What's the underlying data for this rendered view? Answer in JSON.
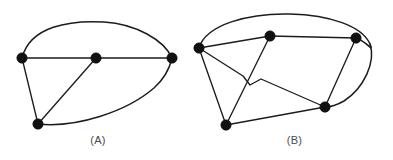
{
  "figure": {
    "width": 393,
    "height": 160,
    "background_color": "#ffffff",
    "ink_color": "#1c1c1c",
    "vertex_color": "#111111",
    "caption_color": "#4a4a4a"
  },
  "panels": [
    {
      "id": "panel-a",
      "caption": "(A)",
      "kind": "graph-diagram",
      "vertex_count": 4,
      "edge_count": 6,
      "vertices": [
        {
          "name": "vertex-a-left",
          "label": "left",
          "x": 22,
          "y": 58,
          "r": 5.2,
          "degree": 4
        },
        {
          "name": "vertex-a-center",
          "label": "center",
          "x": 96,
          "y": 58,
          "r": 5.2,
          "degree": 3
        },
        {
          "name": "vertex-a-right",
          "label": "right",
          "x": 172,
          "y": 58,
          "r": 5.2,
          "degree": 4
        },
        {
          "name": "vertex-a-bottom",
          "label": "bottom",
          "x": 38,
          "y": 124,
          "r": 5.2,
          "degree": 3
        }
      ],
      "edges": [
        {
          "name": "edge-a-left-center",
          "from": "left",
          "to": "center",
          "shape": "straight",
          "path": "M 22 58 L 96 58"
        },
        {
          "name": "edge-a-center-right",
          "from": "center",
          "to": "right",
          "shape": "straight",
          "path": "M 96 58 L 172 58"
        },
        {
          "name": "edge-a-left-bottom",
          "from": "left",
          "to": "bottom",
          "shape": "straight",
          "path": "M 22 58 L 38 124"
        },
        {
          "name": "edge-a-center-bottom",
          "from": "center",
          "to": "bottom",
          "shape": "straight",
          "path": "M 96 58 L 38 124"
        },
        {
          "name": "edge-a-left-right-top",
          "from": "left",
          "to": "right",
          "shape": "arc-top",
          "path": "M 22 58 C 30 26 70 20 104 22 C 136 24 164 40 172 58"
        },
        {
          "name": "edge-a-bottom-right-arc",
          "from": "bottom",
          "to": "right",
          "shape": "arc-bottom",
          "path": "M 38 124 C 76 128 126 112 154 88 C 165 78 170 67 172 58"
        }
      ]
    },
    {
      "id": "panel-b",
      "caption": "(B)",
      "kind": "graph-diagram",
      "vertex_count": 5,
      "edge_count": 8,
      "vertices": [
        {
          "name": "vertex-b-left",
          "label": "left",
          "x": 199,
          "y": 48,
          "r": 5.2,
          "degree": 5
        },
        {
          "name": "vertex-b-top",
          "label": "top",
          "x": 270,
          "y": 36,
          "r": 5.2,
          "degree": 3
        },
        {
          "name": "vertex-b-top-right",
          "label": "top-right",
          "x": 356,
          "y": 38,
          "r": 5.2,
          "degree": 3
        },
        {
          "name": "vertex-b-bottom-right",
          "label": "bottom-right",
          "x": 325,
          "y": 107,
          "r": 5.2,
          "degree": 4
        },
        {
          "name": "vertex-b-bottom-left",
          "label": "bottom-left",
          "x": 226,
          "y": 125,
          "r": 5.2,
          "degree": 3
        }
      ],
      "edges": [
        {
          "name": "edge-b-left-top",
          "from": "left",
          "to": "top",
          "shape": "straight",
          "path": "M 199 48 L 270 36"
        },
        {
          "name": "edge-b-top-topright",
          "from": "top",
          "to": "top-right",
          "shape": "straight",
          "path": "M 270 36 L 356 38"
        },
        {
          "name": "edge-b-topright-bottomright",
          "from": "top-right",
          "to": "bottom-right",
          "shape": "straight",
          "path": "M 356 38 L 325 107"
        },
        {
          "name": "edge-b-left-bottomleft",
          "from": "left",
          "to": "bottom-left",
          "shape": "straight",
          "path": "M 199 48 L 226 125"
        },
        {
          "name": "edge-b-top-bottomleft",
          "from": "top",
          "to": "bottom-left",
          "shape": "straight",
          "path": "M 270 36 L 226 125"
        },
        {
          "name": "edge-b-bottomleft-bottomright",
          "from": "bottom-left",
          "to": "bottom-right",
          "shape": "straight",
          "path": "M 226 125 L 325 107"
        },
        {
          "name": "edge-b-left-bottomright-kink",
          "from": "left",
          "to": "bottom-right",
          "shape": "polyline-kinked",
          "path": "M 199 48 L 243 76 L 250 85 L 261 79 L 325 107"
        },
        {
          "name": "edge-b-left-topright-outer",
          "from": "left",
          "to": "top-right",
          "shape": "arc-outer",
          "path": "M 199 48 C 206 24 250 13 290 14 C 330 15 362 26 370 44 C 374 54 368 42 356 38"
        }
      ],
      "extra_outline": {
        "name": "edge-b-outer-right-sweep",
        "description": "outer boundary sweeping from top-right region down around to bottom-right vertex",
        "path": "M 370 44 C 376 62 364 88 344 101 C 337 105 330 107 325 107"
      }
    }
  ]
}
